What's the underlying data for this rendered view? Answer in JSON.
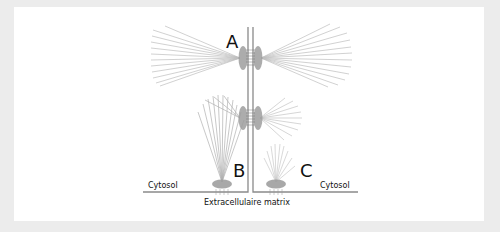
{
  "figure": {
    "labels": {
      "a": "A",
      "b": "B",
      "c": "C",
      "cytosol_left": "Cytosol",
      "cytosol_right": "Cytosol",
      "matrix": "Extracellulaire matrix"
    },
    "colors": {
      "background": "#ececec",
      "panel": "#ffffff",
      "membrane": "#8a8a8a",
      "adhesion": "#9a9a9a",
      "fiber": "#b8b8b8",
      "text": "#111111"
    }
  }
}
